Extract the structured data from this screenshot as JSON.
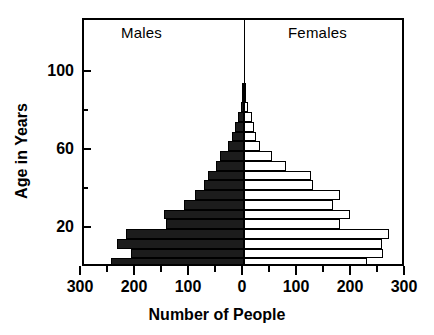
{
  "chart_data": {
    "type": "bar",
    "subtype": "population-pyramid",
    "title": "",
    "xlabel": "Number of People",
    "ylabel": "Age in Years",
    "orientation": "horizontal",
    "grid": false,
    "legend": "none",
    "panel_labels": {
      "left": "Males",
      "right": "Females"
    },
    "xlim": [
      -300,
      300
    ],
    "xticks_major": [
      300,
      200,
      100,
      0,
      100,
      200,
      300
    ],
    "xticks_major_signed": [
      -300,
      -200,
      -100,
      0,
      100,
      200,
      300
    ],
    "xticks_minor_signed": [
      -250,
      -150,
      -50,
      50,
      150,
      250
    ],
    "ylim": [
      0,
      104
    ],
    "yticks_major": [
      20,
      60,
      100
    ],
    "yticks_minor": [
      40,
      80
    ],
    "ytick_labels": [
      "20",
      "60",
      "100"
    ],
    "categories": [
      "0-4",
      "5-9",
      "10-14",
      "15-19",
      "20-24",
      "25-29",
      "30-34",
      "35-39",
      "40-44",
      "45-49",
      "50-54",
      "55-59",
      "60-64",
      "65-69",
      "70-74",
      "75-79",
      "80-84",
      "85-89",
      "90-94"
    ],
    "age_group_lower_bounds": [
      0,
      5,
      10,
      15,
      20,
      25,
      30,
      35,
      40,
      45,
      50,
      55,
      60,
      65,
      70,
      75,
      80,
      85,
      90
    ],
    "series": [
      {
        "name": "Males",
        "side": "left",
        "color": "#1c1c1c",
        "values": [
          246,
          210,
          236,
          218,
          145,
          148,
          112,
          90,
          74,
          66,
          52,
          44,
          30,
          22,
          16,
          11,
          6,
          3,
          2
        ]
      },
      {
        "name": "Females",
        "side": "right",
        "color": "#ffffff",
        "values": [
          228,
          258,
          255,
          268,
          178,
          196,
          165,
          178,
          128,
          124,
          77,
          52,
          30,
          22,
          18,
          14,
          7,
          4,
          2
        ]
      }
    ]
  },
  "axis": {
    "x_title": "Number of People",
    "y_title": "Age in Years",
    "x_labels": [
      "300",
      "200",
      "100",
      "0",
      "100",
      "200",
      "300"
    ],
    "y_labels": [
      "100",
      "60",
      "20"
    ]
  }
}
